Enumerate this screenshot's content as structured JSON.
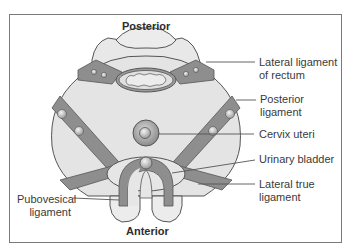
{
  "diagram": {
    "orientation": {
      "top": "Posterior",
      "bottom": "Anterior"
    },
    "labels": [
      {
        "id": "lateral-ligament-of-rectum",
        "line1": "Lateral ligament",
        "line2": "of rectum"
      },
      {
        "id": "posterior-ligament",
        "line1": "Posterior",
        "line2": "ligament"
      },
      {
        "id": "cervix-uteri",
        "line1": "Cervix uteri",
        "line2": ""
      },
      {
        "id": "urinary-bladder",
        "line1": "Urinary bladder",
        "line2": ""
      },
      {
        "id": "lateral-true-ligament",
        "line1": "Lateral true",
        "line2": "ligament"
      },
      {
        "id": "pubovesical-ligament",
        "line1": "Pubovesical",
        "line2": "ligament"
      }
    ],
    "colors": {
      "fill_light": "#e6e6e6",
      "fill_mid": "#c8c8c8",
      "ligament": "#8e8e8e",
      "outline": "#555555",
      "leader_line": "#555555"
    }
  }
}
